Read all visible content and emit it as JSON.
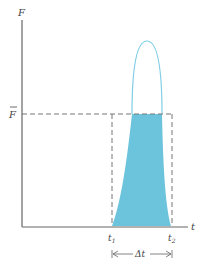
{
  "diagram": {
    "axes": {
      "y_label": "F",
      "x_label": "t"
    },
    "average_force_label": "F̄",
    "time_labels": {
      "t1": "t",
      "t1_sub": "1",
      "t2": "t",
      "t2_sub": "2"
    },
    "interval_label": "Δt",
    "colors": {
      "fill": "#6cc3dc",
      "curve": "#7fcde6",
      "axis": "#666666",
      "dashed": "#777777"
    }
  }
}
